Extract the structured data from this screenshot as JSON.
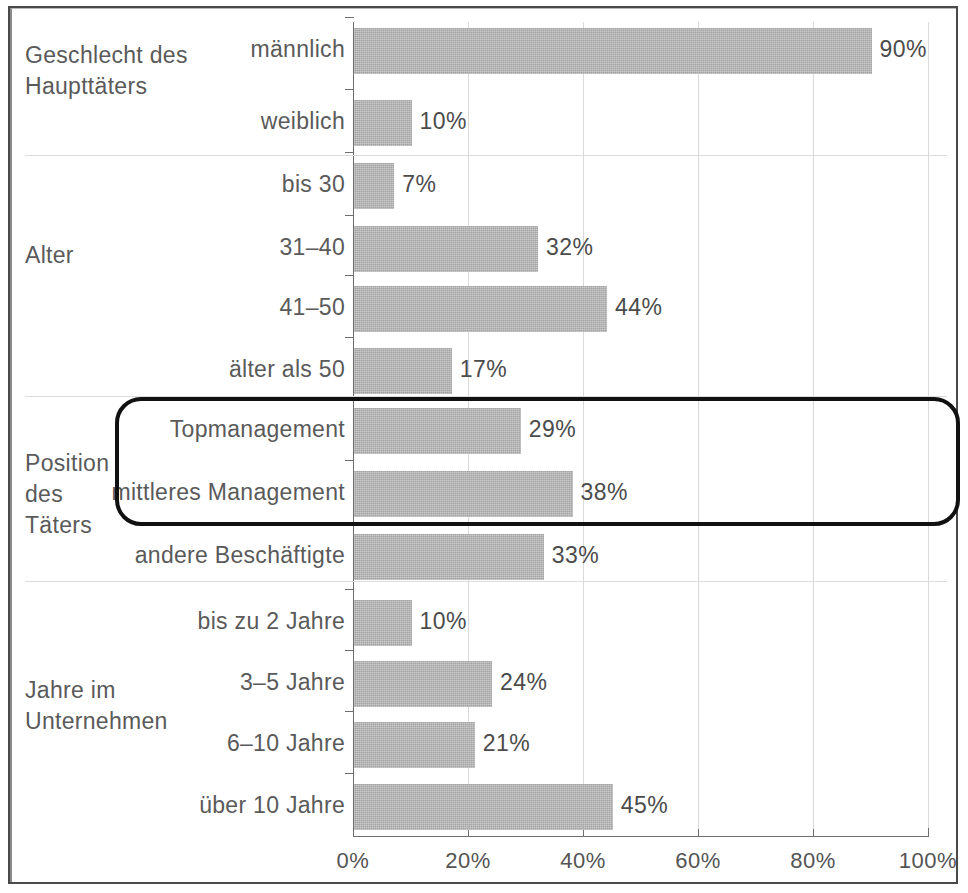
{
  "chart_data": {
    "type": "bar",
    "orientation": "horizontal",
    "title": "",
    "xlabel": "",
    "ylabel": "",
    "xlim": [
      0,
      100
    ],
    "xticks": [
      0,
      20,
      40,
      60,
      80,
      100
    ],
    "xticklabels": [
      "0%",
      "20%",
      "40%",
      "60%",
      "80%",
      "100%"
    ],
    "grid": "vertical",
    "legend": "none",
    "value_suffix": "%",
    "bar_color": "#b4b4b4",
    "groups": [
      {
        "name": "Geschlecht des\nHaupttäters",
        "categories": [
          "männlich",
          "weiblich"
        ],
        "values": [
          90,
          10
        ],
        "value_labels": [
          "90%",
          "10%"
        ]
      },
      {
        "name": "Alter",
        "categories": [
          "bis 30",
          "31–40",
          "41–50",
          "älter als 50"
        ],
        "values": [
          7,
          32,
          44,
          17
        ],
        "value_labels": [
          "7%",
          "32%",
          "44%",
          "17%"
        ]
      },
      {
        "name": "Position\ndes\nTäters",
        "categories": [
          "Topmanagement",
          "mittleres Management",
          "andere Beschäftigte"
        ],
        "values": [
          29,
          38,
          33
        ],
        "value_labels": [
          "29%",
          "38%",
          "33%"
        ]
      },
      {
        "name": "Jahre im\nUnternehmen",
        "categories": [
          "bis zu 2 Jahre",
          "3–5 Jahre",
          "6–10 Jahre",
          "über 10 Jahre"
        ],
        "values": [
          10,
          24,
          21,
          45
        ],
        "value_labels": [
          "10%",
          "24%",
          "21%",
          "45%"
        ]
      }
    ],
    "annotations": [
      {
        "type": "rounded-rectangle-highlight",
        "color": "#111111",
        "encloses": [
          "Topmanagement",
          "mittleres Management"
        ]
      }
    ],
    "flat_categories": [
      "männlich",
      "weiblich",
      "bis 30",
      "31–40",
      "41–50",
      "älter als 50",
      "Topmanagement",
      "mittleres Management",
      "andere Beschäftigte",
      "bis zu 2 Jahre",
      "3–5 Jahre",
      "6–10 Jahre",
      "über 10 Jahre"
    ],
    "flat_values": [
      90,
      10,
      7,
      32,
      44,
      17,
      29,
      38,
      33,
      10,
      24,
      21,
      45
    ]
  },
  "rows": [
    {
      "label": "männlich",
      "value_label": "90%",
      "value": 90,
      "top": 28,
      "height": 46
    },
    {
      "label": "weiblich",
      "value_label": "10%",
      "value": 10,
      "top": 100,
      "height": 46
    },
    {
      "label": "bis 30",
      "value_label": "7%",
      "value": 7,
      "top": 163,
      "height": 46
    },
    {
      "label": "31–40",
      "value_label": "32%",
      "value": 32,
      "top": 226,
      "height": 46
    },
    {
      "label": "41–50",
      "value_label": "44%",
      "value": 44,
      "top": 286,
      "height": 46
    },
    {
      "label": "älter als 50",
      "value_label": "17%",
      "value": 17,
      "top": 348,
      "height": 46
    },
    {
      "label": "Topmanagement",
      "value_label": "29%",
      "value": 29,
      "top": 408,
      "height": 46
    },
    {
      "label": "mittleres Management",
      "value_label": "38%",
      "value": 38,
      "top": 471,
      "height": 46
    },
    {
      "label": "andere Beschäftigte",
      "value_label": "33%",
      "value": 33,
      "top": 534,
      "height": 46
    },
    {
      "label": "bis zu 2 Jahre",
      "value_label": "10%",
      "value": 10,
      "top": 600,
      "height": 46
    },
    {
      "label": "3–5 Jahre",
      "value_label": "24%",
      "value": 24,
      "top": 661,
      "height": 46
    },
    {
      "label": "6–10 Jahre",
      "value_label": "21%",
      "value": 21,
      "top": 722,
      "height": 46
    },
    {
      "label": "über 10 Jahre",
      "value_label": "45%",
      "value": 45,
      "top": 784,
      "height": 46
    }
  ],
  "group_titles": [
    {
      "text": "Geschlecht des\nHaupttäters",
      "top": 40
    },
    {
      "text": "Alter",
      "top": 240
    },
    {
      "text": "Position\ndes\nTäters",
      "top": 448
    },
    {
      "text": "Jahre im\nUnternehmen",
      "top": 675
    }
  ],
  "separators": [
    155,
    396,
    581
  ],
  "axis": {
    "ticks": [
      {
        "label": "0%",
        "value": 0
      },
      {
        "label": "20%",
        "value": 20
      },
      {
        "label": "40%",
        "value": 40
      },
      {
        "label": "60%",
        "value": 60
      },
      {
        "label": "80%",
        "value": 80
      },
      {
        "label": "100%",
        "value": 100
      }
    ]
  }
}
